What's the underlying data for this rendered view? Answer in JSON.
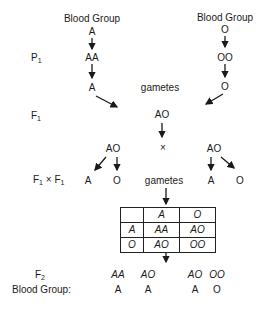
{
  "parents": {
    "left": {
      "label": "Blood Group",
      "phenotype": "A",
      "genotype": "AA",
      "gamete": "A"
    },
    "right": {
      "label": "Blood Group",
      "phenotype": "O",
      "genotype": "OO",
      "gamete": "O"
    }
  },
  "generations": {
    "p1": {
      "base": "P",
      "sub": "1"
    },
    "f1": {
      "base": "F",
      "sub": "1"
    },
    "cross": {
      "base1": "F",
      "sub1": "1",
      "times": "×",
      "base2": "F",
      "sub2": "1"
    },
    "f2": {
      "base": "F",
      "sub": "2"
    }
  },
  "labels": {
    "gametes_top": "gametes",
    "gametes_mid": "gametes",
    "cross_symbol": "×",
    "blood_group_row": "Blood Group:"
  },
  "f1": {
    "genotype": "AO",
    "left_parent": {
      "genotype": "AO",
      "gametes": [
        "A",
        "O"
      ]
    },
    "right_parent": {
      "genotype": "AO",
      "gametes": [
        "A",
        "O"
      ]
    }
  },
  "punnett": {
    "header": [
      "",
      "A",
      "O"
    ],
    "rows": [
      [
        "A",
        "AA",
        "AO"
      ],
      [
        "O",
        "AO",
        "OO"
      ]
    ]
  },
  "f2": {
    "genotypes": [
      "AA",
      "AO",
      "AO",
      "OO"
    ],
    "blood_groups": [
      "A",
      "A",
      "A",
      "O"
    ]
  }
}
